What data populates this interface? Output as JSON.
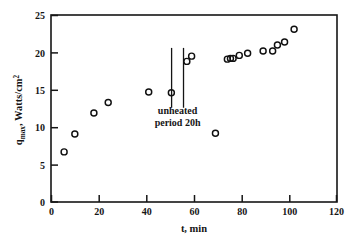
{
  "chart_data": {
    "type": "scatter",
    "title": "",
    "xlabel": "t,  min",
    "ylabel_parts": {
      "base": "q",
      "subscript": "max",
      "rest": ",  Watts/cm",
      "superscript": "2"
    },
    "ylabel": "q_max,  Watts/cm2",
    "xlim": [
      0,
      120
    ],
    "ylim": [
      0,
      25
    ],
    "xticks": [
      0,
      20,
      40,
      60,
      80,
      100,
      120
    ],
    "xtick_labels": [
      "0",
      "20",
      "40",
      "60",
      "80",
      "100",
      "120"
    ],
    "yticks": [
      0,
      5,
      10,
      15,
      20,
      25
    ],
    "ytick_labels": [
      "0",
      "5",
      "10",
      "15",
      "20",
      "25"
    ],
    "grid": false,
    "legend": false,
    "marker_style": "open-circle",
    "series": [
      {
        "name": "q_max vs t",
        "x": [
          5.5,
          10.0,
          18.0,
          24.0,
          41.0,
          50.5,
          57.0,
          59.0,
          69.0,
          74.0,
          75.3,
          76.4,
          79.0,
          82.5,
          89.0,
          93.0,
          95.0,
          98.0,
          102.0
        ],
        "y": [
          6.7,
          9.1,
          11.9,
          13.3,
          14.7,
          14.6,
          18.8,
          19.5,
          9.2,
          19.1,
          19.2,
          19.2,
          19.6,
          19.9,
          20.2,
          20.2,
          21.0,
          21.4,
          23.1
        ]
      }
    ],
    "annotations": [
      {
        "name": "unheated-period",
        "line1": "unheated",
        "line2": "period  20h",
        "text_x": 53,
        "text_y1": 11.7,
        "text_y2": 10.2,
        "vlines": [
          {
            "x": 50.6,
            "y_top": 20.6,
            "y_bottom": 12.6
          },
          {
            "x": 55.6,
            "y_top": 20.6,
            "y_bottom": 12.6
          }
        ]
      }
    ],
    "colors": {
      "axis": "#161616",
      "marker": "#101010",
      "background": "#ffffff"
    }
  }
}
